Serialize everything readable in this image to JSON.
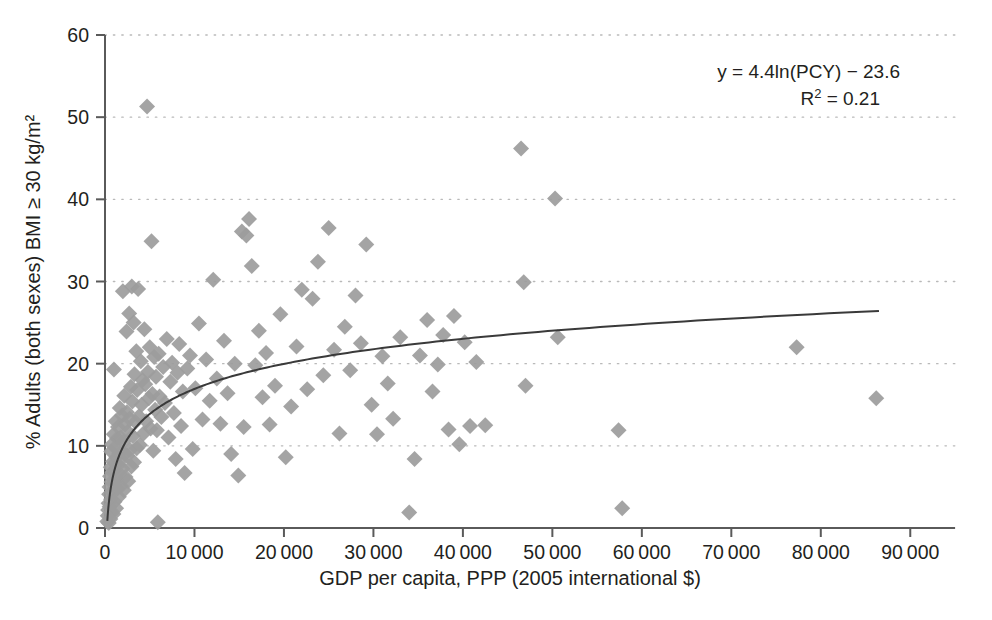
{
  "chart_data": {
    "type": "scatter",
    "title": "",
    "xlabel": "GDP per capita, PPP (2005 international $)",
    "ylabel": "% Adults (both sexes) BMI ≥ 30 kg/m²",
    "xlim": [
      0,
      95000
    ],
    "ylim": [
      0,
      60
    ],
    "xticks": [
      0,
      10000,
      20000,
      30000,
      40000,
      50000,
      60000,
      70000,
      80000,
      90000
    ],
    "xtick_labels": [
      "0",
      "10 000",
      "20 000",
      "30 000",
      "40 000",
      "50 000",
      "60 000",
      "70 000",
      "80 000",
      "90 000"
    ],
    "yticks": [
      0,
      10,
      20,
      30,
      40,
      50,
      60
    ],
    "ytick_labels": [
      "0",
      "10",
      "20",
      "30",
      "40",
      "50",
      "60"
    ],
    "grid": "horizontal-dotted",
    "legend": "none",
    "marker": {
      "shape": "diamond",
      "color": "#9c9c9c",
      "size_px": 16
    },
    "trendline": {
      "type": "logarithmic",
      "equation": "y = 4.4ln(PCY) − 23.6",
      "r_squared": "R² = 0.21",
      "coefficient": 4.4,
      "intercept": -23.6,
      "color": "#3a3a3a",
      "x_start": 260,
      "x_end": 86500
    },
    "annotations": [
      {
        "id": "equation",
        "text": "y = 4.4ln(PCY) − 23.6"
      },
      {
        "id": "r-squared",
        "text": "R",
        "sup": "2",
        "tail": " = 0.21"
      }
    ],
    "points": [
      [
        250,
        0.8
      ],
      [
        300,
        1.5
      ],
      [
        350,
        2.2
      ],
      [
        400,
        3.0
      ],
      [
        420,
        0.6
      ],
      [
        460,
        4.1
      ],
      [
        500,
        5.0
      ],
      [
        520,
        2.6
      ],
      [
        560,
        6.3
      ],
      [
        600,
        1.1
      ],
      [
        640,
        7.4
      ],
      [
        680,
        3.5
      ],
      [
        700,
        9.3
      ],
      [
        720,
        5.6
      ],
      [
        760,
        2.0
      ],
      [
        800,
        10.2
      ],
      [
        820,
        6.8
      ],
      [
        860,
        4.3
      ],
      [
        900,
        8.1
      ],
      [
        940,
        1.7
      ],
      [
        980,
        11.4
      ],
      [
        1000,
        19.3
      ],
      [
        1020,
        7.0
      ],
      [
        1060,
        3.2
      ],
      [
        1100,
        9.8
      ],
      [
        1150,
        5.4
      ],
      [
        1200,
        13.0
      ],
      [
        1240,
        2.4
      ],
      [
        1280,
        8.6
      ],
      [
        1320,
        6.0
      ],
      [
        1360,
        10.9
      ],
      [
        1400,
        4.8
      ],
      [
        1450,
        12.3
      ],
      [
        1500,
        7.7
      ],
      [
        1550,
        3.8
      ],
      [
        1600,
        9.1
      ],
      [
        1650,
        14.6
      ],
      [
        1700,
        6.5
      ],
      [
        1750,
        11.0
      ],
      [
        1800,
        5.1
      ],
      [
        1850,
        8.3
      ],
      [
        1900,
        13.7
      ],
      [
        1950,
        7.2
      ],
      [
        2000,
        28.8
      ],
      [
        2050,
        10.5
      ],
      [
        2100,
        4.6
      ],
      [
        2150,
        16.1
      ],
      [
        2200,
        9.0
      ],
      [
        2250,
        12.6
      ],
      [
        2300,
        6.2
      ],
      [
        2400,
        23.9
      ],
      [
        2450,
        14.1
      ],
      [
        2500,
        8.8
      ],
      [
        2550,
        11.7
      ],
      [
        2600,
        5.7
      ],
      [
        2700,
        26.1
      ],
      [
        2750,
        13.3
      ],
      [
        2800,
        9.5
      ],
      [
        2900,
        17.2
      ],
      [
        2950,
        7.5
      ],
      [
        3000,
        29.4
      ],
      [
        3050,
        15.4
      ],
      [
        3100,
        11.2
      ],
      [
        3200,
        25.0
      ],
      [
        3250,
        8.0
      ],
      [
        3300,
        18.7
      ],
      [
        3400,
        12.9
      ],
      [
        3500,
        21.5
      ],
      [
        3550,
        9.7
      ],
      [
        3600,
        16.8
      ],
      [
        3700,
        29.1
      ],
      [
        3800,
        13.6
      ],
      [
        3900,
        10.1
      ],
      [
        4000,
        20.3
      ],
      [
        4100,
        15.0
      ],
      [
        4200,
        18.0
      ],
      [
        4300,
        11.5
      ],
      [
        4400,
        24.2
      ],
      [
        4500,
        17.5
      ],
      [
        4600,
        13.0
      ],
      [
        4700,
        51.3
      ],
      [
        4800,
        19.0
      ],
      [
        4900,
        15.8
      ],
      [
        5000,
        22.0
      ],
      [
        5100,
        12.1
      ],
      [
        5200,
        34.9
      ],
      [
        5300,
        16.3
      ],
      [
        5400,
        9.4
      ],
      [
        5500,
        20.8
      ],
      [
        5600,
        14.4
      ],
      [
        5700,
        18.4
      ],
      [
        5800,
        11.9
      ],
      [
        5900,
        0.7
      ],
      [
        6000,
        21.2
      ],
      [
        6100,
        16.0
      ],
      [
        6300,
        13.5
      ],
      [
        6500,
        19.6
      ],
      [
        6700,
        15.2
      ],
      [
        6900,
        23.0
      ],
      [
        7100,
        11.0
      ],
      [
        7300,
        17.8
      ],
      [
        7500,
        20.1
      ],
      [
        7700,
        14.0
      ],
      [
        7900,
        8.4
      ],
      [
        8100,
        18.9
      ],
      [
        8300,
        22.4
      ],
      [
        8500,
        12.4
      ],
      [
        8700,
        16.6
      ],
      [
        8900,
        6.7
      ],
      [
        9200,
        19.4
      ],
      [
        9500,
        21.0
      ],
      [
        9800,
        9.6
      ],
      [
        10100,
        17.0
      ],
      [
        10500,
        24.9
      ],
      [
        10900,
        13.2
      ],
      [
        11300,
        20.5
      ],
      [
        11700,
        15.5
      ],
      [
        12100,
        30.2
      ],
      [
        12500,
        18.2
      ],
      [
        12900,
        12.7
      ],
      [
        13300,
        22.8
      ],
      [
        13700,
        16.4
      ],
      [
        14100,
        9.0
      ],
      [
        14500,
        20.0
      ],
      [
        14900,
        6.4
      ],
      [
        15300,
        36.1
      ],
      [
        15500,
        12.3
      ],
      [
        15800,
        35.6
      ],
      [
        16100,
        37.6
      ],
      [
        16400,
        31.9
      ],
      [
        16800,
        19.8
      ],
      [
        17200,
        24.0
      ],
      [
        17600,
        15.9
      ],
      [
        18000,
        21.3
      ],
      [
        18400,
        12.6
      ],
      [
        19000,
        17.3
      ],
      [
        19600,
        26.0
      ],
      [
        20200,
        8.6
      ],
      [
        20800,
        14.8
      ],
      [
        21400,
        22.1
      ],
      [
        22000,
        29.0
      ],
      [
        22600,
        16.9
      ],
      [
        23200,
        27.9
      ],
      [
        23800,
        32.4
      ],
      [
        24400,
        18.6
      ],
      [
        25000,
        36.5
      ],
      [
        25600,
        21.7
      ],
      [
        26200,
        11.5
      ],
      [
        26800,
        24.5
      ],
      [
        27400,
        19.2
      ],
      [
        28000,
        28.3
      ],
      [
        28600,
        22.5
      ],
      [
        29200,
        34.5
      ],
      [
        29800,
        15.0
      ],
      [
        30400,
        11.4
      ],
      [
        31000,
        20.9
      ],
      [
        31600,
        17.6
      ],
      [
        32200,
        13.3
      ],
      [
        33000,
        23.2
      ],
      [
        34000,
        1.9
      ],
      [
        34600,
        8.4
      ],
      [
        35200,
        21.0
      ],
      [
        36000,
        25.3
      ],
      [
        36600,
        16.6
      ],
      [
        37200,
        19.9
      ],
      [
        37800,
        23.5
      ],
      [
        38400,
        12.0
      ],
      [
        39000,
        25.8
      ],
      [
        39600,
        10.2
      ],
      [
        40200,
        22.6
      ],
      [
        40800,
        12.4
      ],
      [
        41500,
        20.2
      ],
      [
        42500,
        12.5
      ],
      [
        46500,
        46.2
      ],
      [
        46800,
        29.9
      ],
      [
        47000,
        17.3
      ],
      [
        50300,
        40.1
      ],
      [
        50600,
        23.2
      ],
      [
        57400,
        11.9
      ],
      [
        57800,
        2.4
      ],
      [
        77300,
        22.0
      ],
      [
        86200,
        15.8
      ]
    ]
  },
  "geometry": {
    "plot_left": 105,
    "plot_right": 955,
    "plot_top": 35,
    "plot_bottom": 528
  }
}
